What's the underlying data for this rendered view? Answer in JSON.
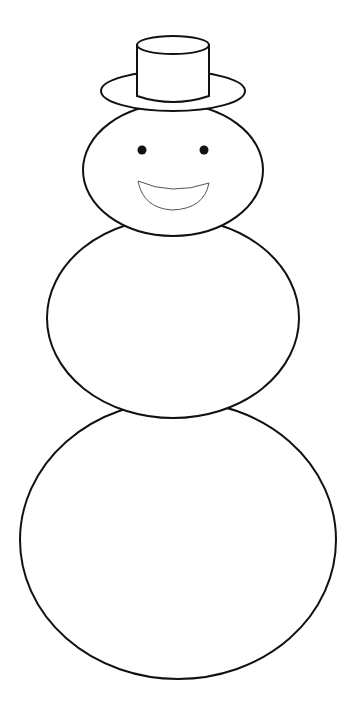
{
  "colors": {
    "stroke": "#111111",
    "fill": "#ffffff",
    "mouth_stroke": "#555555"
  },
  "parts": [
    "top-hat",
    "head",
    "eyes",
    "smile",
    "middle-body",
    "bottom-body"
  ]
}
